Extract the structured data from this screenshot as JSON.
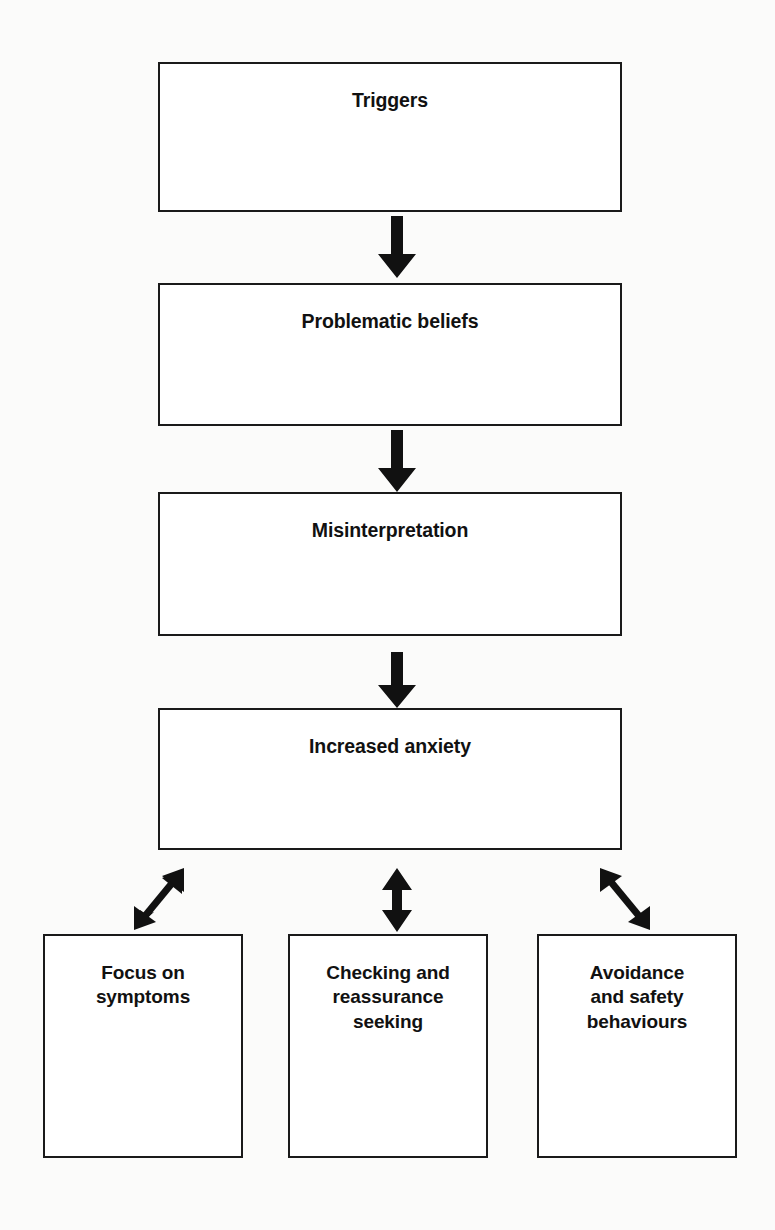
{
  "diagram": {
    "type": "flowchart",
    "background_color": "#fbfbfa",
    "box_border_color": "#1a1a1a",
    "text_color": "#111111",
    "nodes": [
      {
        "id": "triggers",
        "label": "Triggers"
      },
      {
        "id": "beliefs",
        "label": "Problematic beliefs"
      },
      {
        "id": "misinterp",
        "label": "Misinterpretation"
      },
      {
        "id": "anxiety",
        "label": "Increased anxiety"
      },
      {
        "id": "focus",
        "label": "Focus on\nsymptoms"
      },
      {
        "id": "checking",
        "label": "Checking and\nreassurance\nseeking"
      },
      {
        "id": "avoidance",
        "label": "Avoidance\nand safety\nbehaviours"
      }
    ],
    "connectors": [
      {
        "id": "triggers-to-beliefs",
        "from": "triggers",
        "to": "beliefs",
        "style": "single-headed",
        "direction": "down"
      },
      {
        "id": "beliefs-to-misinterp",
        "from": "beliefs",
        "to": "misinterp",
        "style": "single-headed",
        "direction": "down"
      },
      {
        "id": "misinterp-to-anxiety",
        "from": "misinterp",
        "to": "anxiety",
        "style": "single-headed",
        "direction": "down"
      },
      {
        "id": "anxiety-to-focus",
        "from": "anxiety",
        "to": "focus",
        "style": "double-headed",
        "direction": "diagonal-down-left"
      },
      {
        "id": "anxiety-to-checking",
        "from": "anxiety",
        "to": "checking",
        "style": "double-headed",
        "direction": "vertical"
      },
      {
        "id": "anxiety-to-avoidance",
        "from": "anxiety",
        "to": "avoidance",
        "style": "double-headed",
        "direction": "diagonal-down-right"
      }
    ]
  }
}
